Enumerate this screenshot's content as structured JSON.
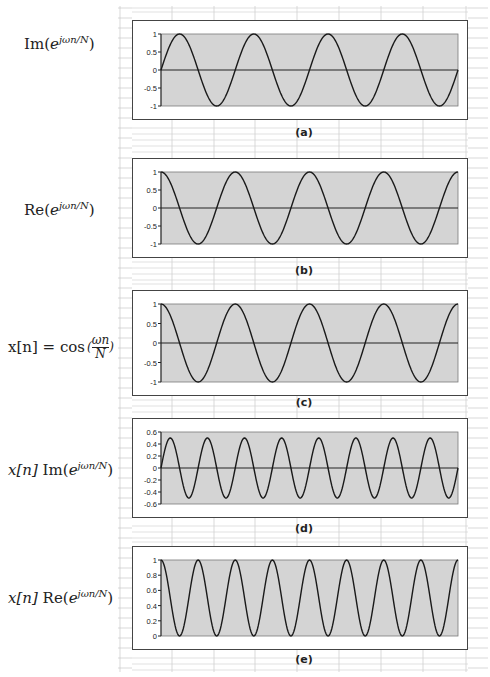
{
  "figure": {
    "panels": [
      {
        "id": "a",
        "caption": "(a)",
        "formula": {
          "prefix": "",
          "func": "Im",
          "base": "e",
          "exponent": "jωn/N"
        }
      },
      {
        "id": "b",
        "caption": "(b)",
        "formula": {
          "prefix": "",
          "func": "Re",
          "base": "e",
          "exponent": "jωn/N"
        }
      },
      {
        "id": "c",
        "caption": "(c)",
        "formula": {
          "prefix": "x[n] = cos",
          "frac_num": "ωn",
          "frac_den": "N"
        }
      },
      {
        "id": "d",
        "caption": "(d)",
        "formula": {
          "prefix": "x[n]",
          "func": "Im",
          "base": "e",
          "exponent": "jωn/N"
        }
      },
      {
        "id": "e",
        "caption": "(e)",
        "formula": {
          "prefix": "x[n]",
          "func": "Re",
          "base": "e",
          "exponent": "jωn/N"
        }
      }
    ]
  },
  "chart_data": [
    {
      "type": "line",
      "panel": "a",
      "title": "Im(e^{jωn/N})",
      "function": "sin",
      "amplitude": 1,
      "offset": 0,
      "cycles": 4,
      "phase": "sine",
      "yticks": [
        "1",
        "0.5",
        "0",
        "-0.5",
        "-1"
      ],
      "ylim": [
        -1,
        1
      ],
      "xlabel": "",
      "ylabel": "",
      "grid": false,
      "legend": "none",
      "plot_bg": "#d4d4d4",
      "line_color": "#1a1a1a"
    },
    {
      "type": "line",
      "panel": "b",
      "title": "Re(e^{jωn/N})",
      "function": "cos",
      "amplitude": 1,
      "offset": 0,
      "cycles": 4,
      "phase": "cosine",
      "yticks": [
        "1",
        "0.5",
        "0",
        "-0.5",
        "-1"
      ],
      "ylim": [
        -1,
        1
      ],
      "xlabel": "",
      "ylabel": "",
      "grid": false,
      "legend": "none",
      "plot_bg": "#d4d4d4",
      "line_color": "#1a1a1a"
    },
    {
      "type": "line",
      "panel": "c",
      "title": "x[n] = cos(ωn/N)",
      "function": "cos",
      "amplitude": 1,
      "offset": 0,
      "cycles": 4,
      "phase": "cosine",
      "yticks": [
        "1",
        "0.5",
        "0",
        "-0.5",
        "-1"
      ],
      "ylim": [
        -1,
        1
      ],
      "xlabel": "",
      "ylabel": "",
      "grid": false,
      "legend": "none",
      "plot_bg": "#d4d4d4",
      "line_color": "#1a1a1a"
    },
    {
      "type": "line",
      "panel": "d",
      "title": "x[n] Im(e^{jωn/N})",
      "function": "0.5*sin(2θ)",
      "amplitude": 0.5,
      "offset": 0,
      "cycles": 8,
      "phase": "sine",
      "yticks": [
        "0.6",
        "0.4",
        "0.2",
        "0",
        "-0.2",
        "-0.4",
        "-0.6"
      ],
      "ylim": [
        -0.6,
        0.6
      ],
      "xlabel": "",
      "ylabel": "",
      "grid": false,
      "legend": "none",
      "plot_bg": "#d4d4d4",
      "line_color": "#1a1a1a"
    },
    {
      "type": "line",
      "panel": "e",
      "title": "x[n] Re(e^{jωn/N})",
      "function": "cos²θ",
      "amplitude": 0.5,
      "offset": 0.5,
      "cycles": 8,
      "phase": "cosine",
      "yticks": [
        "1",
        "0.8",
        "0.6",
        "0.4",
        "0.2",
        "0"
      ],
      "ylim": [
        0,
        1
      ],
      "xlabel": "",
      "ylabel": "",
      "grid": false,
      "legend": "none",
      "plot_bg": "#d4d4d4",
      "line_color": "#1a1a1a"
    }
  ]
}
